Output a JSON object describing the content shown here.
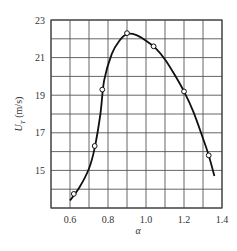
{
  "chart_data": {
    "type": "line",
    "title": "",
    "xlabel": "α",
    "ylabel": "U_T (m/s)",
    "xlim": [
      0.5,
      1.4
    ],
    "ylim": [
      13,
      23
    ],
    "grid": true,
    "x_ticks": [
      "0.6",
      "0.8",
      "1.0",
      "1.2",
      "1.4"
    ],
    "y_ticks": [
      "15",
      "17",
      "19",
      "21",
      "23"
    ],
    "series": [
      {
        "name": "measured points",
        "marker": "open-circle",
        "x": [
          0.62,
          0.73,
          0.77,
          0.9,
          1.04,
          1.2,
          1.33
        ],
        "y": [
          13.75,
          16.3,
          19.3,
          22.3,
          21.6,
          19.2,
          15.8
        ]
      },
      {
        "name": "fitted curve",
        "marker": "none",
        "x": [
          0.6,
          0.65,
          0.7,
          0.73,
          0.76,
          0.78,
          0.82,
          0.86,
          0.9,
          0.95,
          1.0,
          1.05,
          1.1,
          1.15,
          1.2,
          1.25,
          1.3,
          1.33,
          1.36
        ],
        "y": [
          13.4,
          14.1,
          15.1,
          16.2,
          18.0,
          19.8,
          21.2,
          21.9,
          22.25,
          22.2,
          21.9,
          21.5,
          20.9,
          20.1,
          19.2,
          18.1,
          16.7,
          15.8,
          14.7
        ]
      }
    ]
  }
}
